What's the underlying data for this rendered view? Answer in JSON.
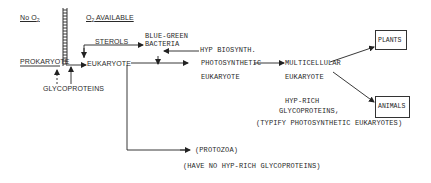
{
  "diagram": {
    "regions": {
      "no_oxygen": "No O",
      "no_oxygen_sub": "2",
      "oxygen_available": "O",
      "oxygen_available_sub": "2",
      "oxygen_available_suffix": " AVAILABLE"
    },
    "nodes": {
      "prokaryote": "PROKARYOTE",
      "glycoproteins": "GLYCOPROTEINS",
      "sterols": "STEROLS",
      "eukaryote": "EUKARYOTE",
      "blue_green_line1": "BLUE-GREEN",
      "blue_green_line2": "BACTERIA",
      "hyp_biosynth": "HYP BIOSYNTH.",
      "photosynthetic_line1": "PHOTOSYNTHETIC",
      "photosynthetic_line2": "EUKARYOTE",
      "multicellular_line1": "MULTICELLULAR",
      "multicellular_line2": "EUKARYOTE",
      "plants": "PLANTS",
      "animals": "ANIMALS",
      "hyp_rich_line1": "HYP-RICH",
      "hyp_rich_line2": "GLYCOPROTEINS,",
      "hyp_rich_note": "(TYPIFY PHOTOSYNTHETIC EUKARYOTES)",
      "protozoa": "(PROTOZOA)",
      "protozoa_note": "(HAVE NO HYP-RICH GLYCOPROTEINS)"
    },
    "edges": [
      {
        "from": "prokaryote",
        "to": "eukaryote"
      },
      {
        "from": "glycoproteins",
        "to": "prokaryote",
        "style": "dashed"
      },
      {
        "from": "glycoproteins",
        "to": "eukaryote"
      },
      {
        "from": "sterols",
        "to": "eukaryote"
      },
      {
        "from": "sterols",
        "to": "blue_green"
      },
      {
        "from": "hyp_biosynth",
        "to": "blue_green"
      },
      {
        "from": "blue_green",
        "to": "photosynthetic"
      },
      {
        "from": "eukaryote",
        "to": "photosynthetic"
      },
      {
        "from": "photosynthetic",
        "to": "multicellular"
      },
      {
        "from": "multicellular",
        "to": "plants"
      },
      {
        "from": "multicellular",
        "to": "animals"
      },
      {
        "from": "eukaryote",
        "to": "protozoa"
      }
    ]
  }
}
